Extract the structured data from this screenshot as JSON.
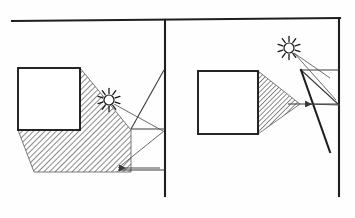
{
  "diagram": {
    "background_color": "#fefefe",
    "ink_color": "#2a2a2a",
    "width": 355,
    "height": 218,
    "panels": [
      {
        "id": "left-panel",
        "label": "Diverging shadow panel",
        "occluder": {
          "name": "square-occluder-left",
          "shape": "square",
          "x": 18,
          "y": 68,
          "width": 62,
          "height": 62
        },
        "light_source": {
          "name": "sun-left",
          "type": "starburst",
          "cx": 109,
          "cy": 100,
          "radius": 6,
          "spikes": 10
        },
        "shadow": {
          "name": "shadow-region-left",
          "type": "diverging",
          "hatch_angle": 45,
          "points": "80,68 80,130 18,130 34,172 131,172 131,130"
        },
        "arrow": {
          "name": "shadow-arrow-left",
          "from_x": 160,
          "from_y": 168,
          "to_x": 118,
          "to_y": 168,
          "direction": "left"
        }
      },
      {
        "id": "right-panel",
        "label": "Converging shadow panel",
        "occluder": {
          "name": "square-occluder-right",
          "shape": "square",
          "x": 198,
          "y": 71,
          "width": 60,
          "height": 63
        },
        "light_source": {
          "name": "sun-right",
          "type": "starburst",
          "cx": 289,
          "cy": 48,
          "radius": 6,
          "spikes": 10
        },
        "shadow": {
          "name": "shadow-region-right",
          "type": "converging",
          "hatch_angle": 45,
          "points": "258,71 258,134 300,104"
        },
        "arrow": {
          "name": "shadow-arrow-right",
          "from_x": 340,
          "from_y": 105,
          "to_x": 304,
          "to_y": 104,
          "direction": "left"
        }
      }
    ],
    "structure": {
      "top_rail": {
        "name": "top-horizontal-rail",
        "x1": 12,
        "y1": 21,
        "x2": 340,
        "y2": 18
      },
      "center_wall": {
        "name": "center-vertical-wall",
        "x1": 165,
        "y1": 20,
        "x2": 165,
        "y2": 196
      },
      "right_wall": {
        "name": "right-vertical-wall",
        "x1": 339,
        "y1": 19,
        "x2": 339,
        "y2": 196
      }
    },
    "guides": [
      {
        "name": "left-ledge-line",
        "x1": 131,
        "y1": 129,
        "x2": 165,
        "y2": 129
      },
      {
        "name": "left-diagonal-upper",
        "x1": 131,
        "y1": 129,
        "x2": 164,
        "y2": 70
      },
      {
        "name": "left-diagonal-lower",
        "x1": 118,
        "y1": 168,
        "x2": 164,
        "y2": 131
      },
      {
        "name": "left-base-line",
        "x1": 118,
        "y1": 170,
        "x2": 165,
        "y2": 170
      },
      {
        "name": "right-ledge-top",
        "x1": 300,
        "y1": 70,
        "x2": 339,
        "y2": 70
      },
      {
        "name": "right-ledge-mid",
        "x1": 288,
        "y1": 104,
        "x2": 339,
        "y2": 104
      },
      {
        "name": "right-diagonal-a",
        "x1": 301,
        "y1": 70,
        "x2": 338,
        "y2": 104
      },
      {
        "name": "right-diagonal-b",
        "x1": 301,
        "y1": 70,
        "x2": 330,
        "y2": 152
      }
    ],
    "rays": [
      {
        "name": "ray-left-sun-to-ledge",
        "x1": 114,
        "y1": 104,
        "x2": 163,
        "y2": 131
      },
      {
        "name": "ray-right-sun-to-ledge",
        "x1": 294,
        "y1": 53,
        "x2": 330,
        "y2": 78
      },
      {
        "name": "ray-right-sun-to-apex",
        "x1": 294,
        "y1": 53,
        "x2": 336,
        "y2": 100
      }
    ]
  }
}
